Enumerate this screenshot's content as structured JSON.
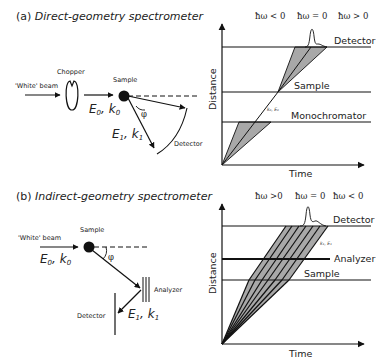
{
  "panel_a": {
    "title_prefix": "(a) ",
    "title_italic": "Direct-geometry spectrometer",
    "schematic": {
      "beam_label": "'White' beam",
      "chopper_label": "Chopper",
      "sample_label": "Sample",
      "incident_label_E": "E",
      "incident_sub_0": "0",
      "incident_label_k": "k",
      "scattered_label_E": "E",
      "scattered_sub_1": "1",
      "scattered_label_k": "k",
      "angle_label": "φ",
      "detector_label": "Detector"
    },
    "plot": {
      "y_axis_label": "Distance",
      "x_axis_label": "Time",
      "lines": [
        "Detector",
        "Sample",
        "Monochromator"
      ],
      "energy_labels": [
        "ħω < 0",
        "ħω = 0",
        "ħω > 0"
      ],
      "ray_label": "k₀, E₀"
    }
  },
  "panel_b": {
    "title_prefix": "(b) ",
    "title_italic": "Indirect-geometry spectrometer",
    "schematic": {
      "beam_label": "'White' beam",
      "sample_label": "Sample",
      "incident_label_E": "E",
      "incident_sub_0": "0",
      "incident_label_k": "k",
      "scattered_label_E": "E",
      "scattered_sub_1": "1",
      "scattered_label_k": "k",
      "angle_label": "φ",
      "analyzer_label": "Analyzer",
      "detector_label": "Detector"
    },
    "plot": {
      "y_axis_label": "Distance",
      "x_axis_label": "Time",
      "lines": [
        "Detector",
        "Analyzer",
        "Sample"
      ],
      "energy_labels": [
        "ħω >0",
        "ħω = 0",
        "ħω < 0"
      ],
      "ray_label": "k₁, E₁"
    }
  }
}
